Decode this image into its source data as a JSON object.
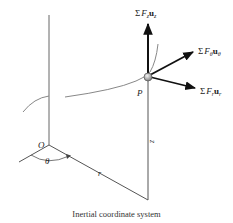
{
  "diagram": {
    "caption": "Inertial coordinate system",
    "point_label": "P",
    "origin_label": "O",
    "angle_label": "θ",
    "radius_label": "r",
    "height_label": "z",
    "forces": {
      "z": {
        "sigma": "Σ",
        "F": "F",
        "sub": "z",
        "u": "u",
        "usub": "z"
      },
      "theta": {
        "sigma": "Σ",
        "F": "F",
        "sub": "θ",
        "u": "u",
        "usub": "θ"
      },
      "r": {
        "sigma": "Σ",
        "F": "F",
        "sub": "r",
        "u": "u",
        "usub": "r"
      }
    },
    "colors": {
      "axis": "#555555",
      "arrow": "#111111",
      "path": "#777777",
      "particle": "#999999"
    }
  }
}
